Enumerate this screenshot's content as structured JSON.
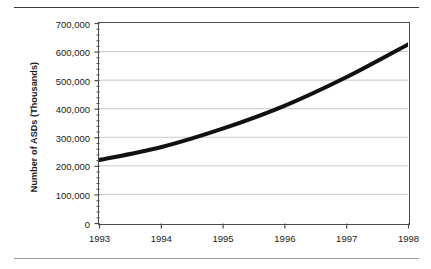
{
  "chart_data": {
    "type": "line",
    "title": "",
    "xlabel": "",
    "ylabel": "Number of ASDs (Thousands)",
    "categories": [
      "1993",
      "1994",
      "1995",
      "1996",
      "1997",
      "1998"
    ],
    "x": [
      1993,
      1994,
      1995,
      1996,
      1997,
      1998
    ],
    "values": [
      220000,
      265000,
      330000,
      410000,
      510000,
      625000
    ],
    "series": [
      {
        "name": "Number of ASDs",
        "values": [
          220000,
          265000,
          330000,
          410000,
          510000,
          625000
        ]
      }
    ],
    "ylim": [
      0,
      700000
    ],
    "xlim": [
      1993,
      1998
    ],
    "y_ticks": [
      0,
      100000,
      200000,
      300000,
      400000,
      500000,
      600000,
      700000
    ],
    "y_tick_labels": [
      "0",
      "100,000",
      "200,000",
      "300,000",
      "400,000",
      "500,000",
      "600,000",
      "700,000"
    ],
    "y_minor_tick_interval": 20000,
    "x_ticks": [
      1993,
      1994,
      1995,
      1996,
      1997,
      1998
    ],
    "x_tick_labels": [
      "1993",
      "1994",
      "1995",
      "1996",
      "1997",
      "1998"
    ],
    "grid": "horizontal",
    "legend": "none",
    "line_color": "#111111",
    "line_width": 4,
    "grid_color": "#c8c8c8",
    "axis_color": "#4a4a4a",
    "background_color": "#ffffff"
  },
  "figure": {
    "rule_top": "",
    "rule_bottom": ""
  }
}
